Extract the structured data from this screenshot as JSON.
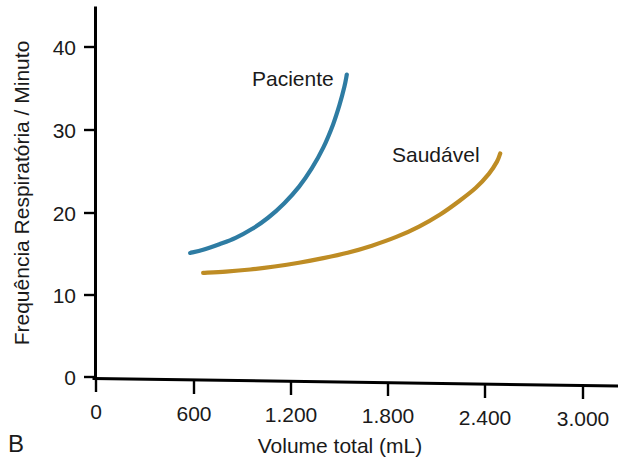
{
  "panel": {
    "label": "B"
  },
  "chart_data": {
    "type": "line",
    "title": "",
    "subtitle": "",
    "xlabel": "Volume total (mL)",
    "ylabel": "Frequência Respiratória / Minuto",
    "xlim": [
      0,
      3000
    ],
    "ylim": [
      0,
      44
    ],
    "xticks": [
      0,
      600,
      1200,
      1800,
      2400,
      3000
    ],
    "xticklabels": [
      "0",
      "600",
      "1.200",
      "1.800",
      "2.400",
      "3.000"
    ],
    "yticks": [
      0,
      10,
      20,
      30,
      40
    ],
    "yticklabels": [
      "0",
      "10",
      "20",
      "30",
      "40"
    ],
    "grid": false,
    "legend": "inline-annotations",
    "series": [
      {
        "name": "Paciente",
        "color": "#2E7CA3",
        "label_position": "above-left-of-curve-top",
        "x": [
          580,
          660,
          760,
          860,
          960,
          1060,
          1160,
          1250,
          1330,
          1400,
          1460,
          1500,
          1530,
          1545
        ],
        "y": [
          15.2,
          15.6,
          16.3,
          17.1,
          18.2,
          19.6,
          21.4,
          23.4,
          25.7,
          28.2,
          31.0,
          33.4,
          35.6,
          37.1
        ]
      },
      {
        "name": "Saudável",
        "color": "#BE8C24",
        "label_position": "above-left-of-curve-top",
        "x": [
          660,
          800,
          950,
          1100,
          1250,
          1400,
          1550,
          1700,
          1850,
          1990,
          2120,
          2240,
          2340,
          2420,
          2470,
          2490
        ],
        "y": [
          12.8,
          13.0,
          13.3,
          13.7,
          14.2,
          14.8,
          15.5,
          16.4,
          17.5,
          18.8,
          20.3,
          22.0,
          23.6,
          25.3,
          26.8,
          27.8
        ]
      }
    ],
    "annotations": [
      {
        "text": "Paciente",
        "x_px": 252,
        "y_px": 86
      },
      {
        "text": "Saudável",
        "x_px": 392,
        "y_px": 162
      }
    ]
  }
}
